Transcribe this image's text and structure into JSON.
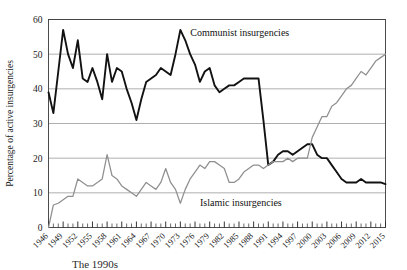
{
  "figure": {
    "caption_fragment": "The 1990s"
  },
  "chart_data": {
    "type": "line",
    "title": "",
    "xlabel": "",
    "ylabel": "Percentage of active insurgencies",
    "ylim": [
      0,
      60
    ],
    "yticks": [
      0,
      10,
      20,
      30,
      40,
      50,
      60
    ],
    "xlim": [
      1946,
      2015
    ],
    "xticks": [
      1946,
      1949,
      1952,
      1955,
      1958,
      1961,
      1964,
      1967,
      1970,
      1973,
      1976,
      1979,
      1982,
      1985,
      1988,
      1991,
      1994,
      1997,
      2000,
      2003,
      2006,
      2009,
      2012,
      2015
    ],
    "xtick_labels": [
      "1946",
      "1949",
      "1952",
      "1955",
      "1958",
      "1961",
      "1964",
      "1967",
      "1970",
      "1973",
      "1976",
      "1979",
      "1982",
      "1985",
      "1988",
      "1991",
      "1994",
      "1997",
      "2000",
      "2003",
      "2006",
      "2009",
      "2012",
      "2015"
    ],
    "xtick_minor_every": 1,
    "grid": "horizontal",
    "grid_color": "#9a9a9a",
    "legend_position": "inline-annotations",
    "x": [
      1946,
      1947,
      1948,
      1949,
      1950,
      1951,
      1952,
      1953,
      1954,
      1955,
      1956,
      1957,
      1958,
      1959,
      1960,
      1961,
      1962,
      1963,
      1964,
      1965,
      1966,
      1967,
      1968,
      1969,
      1970,
      1971,
      1972,
      1973,
      1974,
      1975,
      1976,
      1977,
      1978,
      1979,
      1980,
      1981,
      1982,
      1983,
      1984,
      1985,
      1986,
      1987,
      1988,
      1989,
      1990,
      1991,
      1992,
      1993,
      1994,
      1995,
      1996,
      1997,
      1998,
      1999,
      2000,
      2001,
      2002,
      2003,
      2004,
      2005,
      2006,
      2007,
      2008,
      2009,
      2010,
      2011,
      2012,
      2013,
      2014,
      2015
    ],
    "series": [
      {
        "name": "Communist insurgencies",
        "color": "#121212",
        "width": 1.9,
        "label_x": 1974,
        "label_y": 56,
        "values": [
          39,
          33,
          45,
          57,
          50,
          46,
          54,
          43,
          42,
          46,
          42,
          37,
          50,
          42,
          46,
          45,
          40,
          36,
          31,
          37,
          42,
          43,
          44,
          46,
          45,
          44,
          50,
          57,
          54,
          50,
          47,
          42,
          45,
          46,
          41,
          39,
          40,
          41,
          41,
          42,
          43,
          43,
          43,
          43,
          31,
          18,
          19,
          21,
          22,
          22,
          21,
          22,
          23,
          24,
          24,
          21,
          20,
          20,
          18,
          16,
          14,
          13,
          13,
          13,
          14,
          13,
          13,
          13,
          13,
          12.5
        ]
      },
      {
        "name": "Islamic insurgencies",
        "color": "#8f8f8f",
        "width": 1.25,
        "label_x": 1976,
        "label_y": 7,
        "values": [
          0,
          6.5,
          7,
          8,
          9,
          9,
          14,
          13,
          12,
          12,
          13,
          14,
          21,
          15,
          14,
          12,
          11,
          10,
          9,
          11,
          13,
          12,
          11,
          13,
          17,
          13,
          11,
          7,
          11,
          14,
          16,
          18,
          17,
          19,
          19,
          18,
          17,
          13,
          13,
          14,
          16,
          17,
          18,
          18,
          17,
          18,
          19,
          19,
          19,
          20,
          19,
          20,
          20,
          20,
          26,
          29,
          32,
          32,
          35,
          36,
          38,
          40,
          41,
          43,
          45,
          44,
          46,
          48,
          49,
          50
        ]
      }
    ]
  }
}
